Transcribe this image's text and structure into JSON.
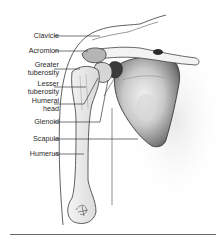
{
  "diagram": {
    "labels": [
      {
        "id": "clavicle",
        "text": "Clavicle",
        "top": 32
      },
      {
        "id": "acromion",
        "text": "Acromion",
        "top": 47
      },
      {
        "id": "greater-tuberosity",
        "text": "Greater\ntuberosity",
        "top": 61
      },
      {
        "id": "lesser-tuberosity",
        "text": "Lesser\ntuberosity",
        "top": 80
      },
      {
        "id": "humeral-head",
        "text": "Humeral\nhead",
        "top": 97
      },
      {
        "id": "glenoid",
        "text": "Glenoid",
        "top": 118
      },
      {
        "id": "scapula",
        "text": "Scapula",
        "top": 135
      },
      {
        "id": "humerus",
        "text": "Humerus",
        "top": 150
      }
    ],
    "colors": {
      "line": "#3a3a3a",
      "bone_fill": "#e6e6e6",
      "scapula_dark": "#2b2b2b",
      "scapula_mid": "#8a8a8a",
      "text": "#2a2a2a",
      "rule": "#6a6a6a"
    }
  }
}
